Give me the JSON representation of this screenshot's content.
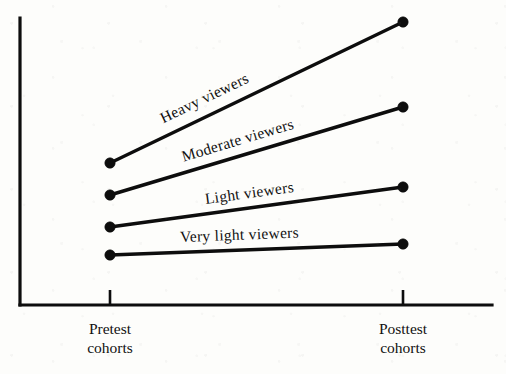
{
  "chart_data": {
    "type": "line",
    "title": "",
    "subtitle": "",
    "xlabel": "",
    "ylabel": "",
    "grid": false,
    "legend": "inline-labels-along-lines",
    "categories": [
      "Pretest cohorts",
      "Posttest cohorts"
    ],
    "x": [
      0,
      1
    ],
    "xlim": [
      -0.31,
      1.305
    ],
    "ylim": [
      0,
      100
    ],
    "axis_tick_labels": [
      {
        "line1": "Pretest",
        "line2": "cohorts"
      },
      {
        "line1": "Posttest",
        "line2": "cohorts"
      }
    ],
    "annotations": [
      "Heavy viewers",
      "Moderate viewers",
      "Light viewers",
      "Very light viewers"
    ],
    "series": [
      {
        "name": "Heavy viewers",
        "label": "Heavy viewers",
        "values": [
          49.5,
          98.6
        ],
        "pixel_points": [
          [
            110,
            163
          ],
          [
            403,
            22
          ]
        ],
        "color": "#0d0d0d",
        "marker": "filled-circle",
        "label_angle_deg": -25.7
      },
      {
        "name": "Moderate viewers",
        "label": "Moderate viewers",
        "values": [
          38.3,
          69.0
        ],
        "pixel_points": [
          [
            110,
            195
          ],
          [
            403,
            107
          ]
        ],
        "color": "#0d0d0d",
        "marker": "filled-circle",
        "label_angle_deg": -16.7
      },
      {
        "name": "Light viewers",
        "label": "Light viewers",
        "values": [
          27.2,
          41.1
        ],
        "pixel_points": [
          [
            110,
            227
          ],
          [
            403,
            187
          ]
        ],
        "color": "#0d0d0d",
        "marker": "filled-circle",
        "label_angle_deg": -7.8
      },
      {
        "name": "Very light viewers",
        "label": "Very light viewers",
        "values": [
          17.4,
          21.3
        ],
        "pixel_points": [
          [
            110,
            255
          ],
          [
            403,
            244
          ]
        ],
        "color": "#0d0d0d",
        "marker": "filled-circle",
        "label_angle_deg": -2.1
      }
    ]
  },
  "axes": {
    "y_axis": {
      "x": 20,
      "y_top": 18,
      "y_bottom": 305
    },
    "x_axis": {
      "y": 305,
      "x_left": 20,
      "x_right": 492
    },
    "ticks": [
      {
        "x": 110,
        "y_top": 290,
        "y_bottom": 305
      },
      {
        "x": 403,
        "y_top": 290,
        "y_bottom": 305
      }
    ],
    "stroke_color": "#0d0d0d"
  }
}
